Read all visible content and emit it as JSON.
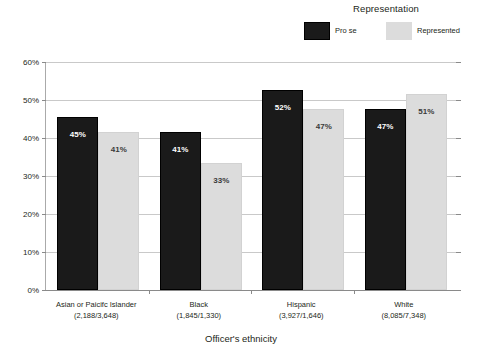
{
  "chart_data": {
    "type": "bar",
    "title": "",
    "xlabel": "Officer's ethnicity",
    "ylabel": "",
    "ylim": [
      0,
      60
    ],
    "ytick_labels": [
      "0%",
      "10%",
      "20%",
      "30%",
      "40%",
      "50%",
      "60%"
    ],
    "ytick_values": [
      0,
      10,
      20,
      30,
      40,
      50,
      60
    ],
    "grid": true,
    "legend_position": "top-right",
    "legend_title": "Representation",
    "categories": [
      "Asian or Paicifc Islander",
      "Black",
      "Hispanic",
      "White"
    ],
    "category_counts": [
      "(2,188/3,648)",
      "(1,845/1,330)",
      "(3,927/1,646)",
      "(8,085/7,348)"
    ],
    "series": [
      {
        "name": "Pro se",
        "color": "#1a1a1a",
        "values": [
          45,
          41,
          52,
          47
        ],
        "labels": [
          "45%",
          "41%",
          "52%",
          "47%"
        ]
      },
      {
        "name": "Represented",
        "color": "#dcdcdc",
        "values": [
          41,
          33,
          47,
          51
        ],
        "labels": [
          "41%",
          "33%",
          "47%",
          "51%"
        ]
      }
    ]
  },
  "legend": {
    "title": "Representation",
    "entries": [
      {
        "label": "Pro se",
        "color": "#1a1a1a"
      },
      {
        "label": "Represented",
        "color": "#dcdcdc"
      }
    ]
  },
  "axes": {
    "x_title": "Officer's ethnicity",
    "y_ticks": [
      "60%",
      "50%",
      "40%",
      "30%",
      "20%",
      "10%",
      "0%"
    ]
  }
}
